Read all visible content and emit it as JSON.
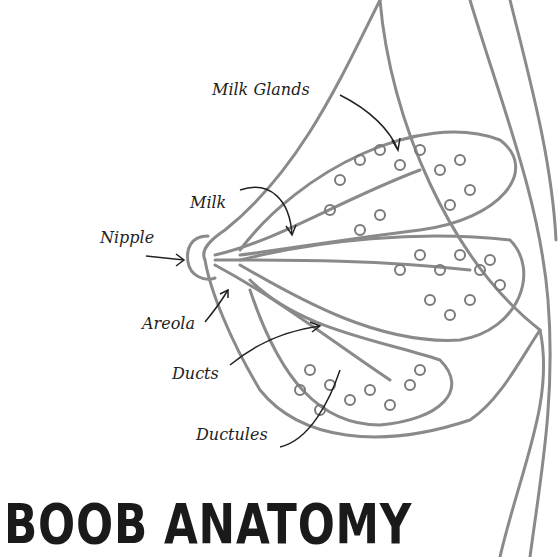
{
  "title": "BOOB ANATOMY",
  "labels": {
    "milk_glands": "Milk Glands",
    "milk": "Milk",
    "nipple": "Nipple",
    "areola": "Areola",
    "ducts": "Ducts",
    "ductules": "Ductules"
  },
  "colors": {
    "line": "#8a8a8a",
    "ink": "#222222",
    "background": "#ffffff"
  }
}
